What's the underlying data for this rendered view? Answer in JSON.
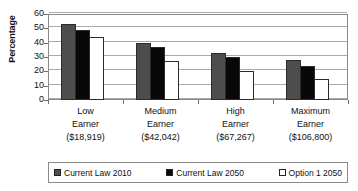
{
  "chart_data": {
    "type": "bar",
    "title": "",
    "xlabel": "",
    "ylabel": "Percentage",
    "ylim": [
      0,
      60
    ],
    "yticks": [
      0,
      10,
      20,
      30,
      40,
      50,
      60
    ],
    "ytick_labels": [
      "0",
      "10",
      "20",
      "30",
      "40",
      "50",
      "60"
    ],
    "grid": true,
    "legend_position": "bottom",
    "categories": [
      "Low Earner ($18,919)",
      "Medium Earner ($42,042)",
      "High Earner ($67,267)",
      "Maximum Earner ($106,800)"
    ],
    "category_lines": [
      [
        "Low",
        "Earner",
        "($18,919)"
      ],
      [
        "Medium",
        "Earner",
        "($42,042)"
      ],
      [
        "High",
        "Earner",
        "($67,267)"
      ],
      [
        "Maximum",
        "Earner",
        "($106,800)"
      ]
    ],
    "series": [
      {
        "name": "Current Law 2010",
        "color": "#4d4d4d",
        "values": [
          53,
          40,
          33,
          28
        ]
      },
      {
        "name": "Current Law 2050",
        "color": "#080808",
        "values": [
          48.5,
          37,
          30,
          24
        ]
      },
      {
        "name": "Option 1 2050",
        "color": "#ffffff",
        "values": [
          44,
          27,
          20,
          15
        ]
      }
    ]
  },
  "axis": {
    "y_title": "Percentage"
  },
  "legend": {
    "items": [
      {
        "label": "Current Law 2010",
        "color": "#4d4d4d"
      },
      {
        "label": "Current Law 2050",
        "color": "#080808"
      },
      {
        "label": "Option 1 2050",
        "color": "#ffffff"
      }
    ]
  },
  "colors": {
    "series_1": "#4d4d4d",
    "series_2": "#080808",
    "series_3": "#ffffff",
    "grid": "#a9a9a9",
    "frame": "#8a8a8a",
    "text": "#111111"
  }
}
